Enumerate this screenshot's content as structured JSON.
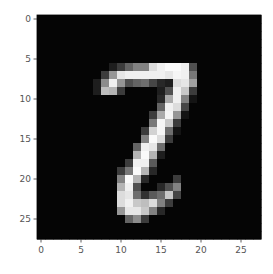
{
  "chart_data": {
    "type": "heatmap",
    "title": "",
    "xlabel": "",
    "ylabel": "",
    "colormap": "gray",
    "value_range": [
      0,
      255
    ],
    "shape": [
      28,
      28
    ],
    "x_ticks": [
      "0",
      "5",
      "10",
      "15",
      "20",
      "25"
    ],
    "y_ticks": [
      "0",
      "5",
      "10",
      "15",
      "20",
      "25"
    ],
    "x_tick_values": [
      0,
      5,
      10,
      15,
      20,
      25
    ],
    "y_tick_values": [
      0,
      5,
      10,
      15,
      20,
      25
    ],
    "xlim": [
      -0.5,
      27.5
    ],
    "ylim": [
      27.5,
      -0.5
    ],
    "sparse_pixels": {
      "6": {
        "9": 30,
        "10": 60,
        "11": 100,
        "12": 130,
        "13": 130,
        "14": 220,
        "15": 240,
        "16": 250,
        "17": 250,
        "18": 240,
        "19": 80
      },
      "7": {
        "8": 60,
        "9": 150,
        "10": 230,
        "11": 240,
        "12": 240,
        "13": 240,
        "14": 240,
        "15": 240,
        "16": 230,
        "17": 245,
        "18": 240,
        "19": 120
      },
      "8": {
        "7": 30,
        "8": 140,
        "9": 240,
        "10": 150,
        "11": 80,
        "12": 100,
        "13": 110,
        "14": 70,
        "15": 40,
        "16": 30,
        "17": 220,
        "18": 230,
        "19": 160
      },
      "9": {
        "7": 30,
        "8": 190,
        "9": 180,
        "10": 60,
        "15": 30,
        "16": 80,
        "17": 240,
        "18": 200,
        "19": 60
      },
      "10": {
        "15": 40,
        "16": 170,
        "17": 240,
        "18": 130,
        "19": 20
      },
      "11": {
        "15": 100,
        "16": 240,
        "17": 220,
        "18": 70
      },
      "12": {
        "14": 60,
        "15": 170,
        "16": 245,
        "17": 150,
        "18": 20
      },
      "13": {
        "14": 120,
        "15": 245,
        "16": 200,
        "17": 60
      },
      "14": {
        "13": 60,
        "14": 210,
        "15": 245,
        "16": 110,
        "17": 20
      },
      "15": {
        "13": 130,
        "14": 250,
        "15": 220,
        "16": 60
      },
      "16": {
        "12": 100,
        "13": 240,
        "14": 230,
        "15": 110
      },
      "17": {
        "12": 180,
        "13": 250,
        "14": 180,
        "15": 30
      },
      "18": {
        "11": 60,
        "12": 240,
        "13": 240,
        "14": 90
      },
      "19": {
        "10": 60,
        "11": 120,
        "12": 250,
        "13": 180,
        "14": 40
      },
      "20": {
        "10": 130,
        "11": 250,
        "12": 180,
        "13": 40,
        "17": 60
      },
      "21": {
        "10": 180,
        "11": 240,
        "12": 80,
        "15": 40,
        "16": 80,
        "17": 130
      },
      "22": {
        "10": 220,
        "11": 230,
        "12": 110,
        "13": 50,
        "14": 90,
        "15": 110,
        "16": 200,
        "17": 70
      },
      "23": {
        "10": 220,
        "11": 240,
        "12": 200,
        "13": 190,
        "14": 220,
        "15": 130,
        "16": 60
      },
      "24": {
        "10": 150,
        "11": 230,
        "12": 230,
        "13": 200,
        "14": 130,
        "15": 40
      },
      "25": {
        "11": 100,
        "12": 140,
        "13": 60
      }
    },
    "background_value": 5
  }
}
